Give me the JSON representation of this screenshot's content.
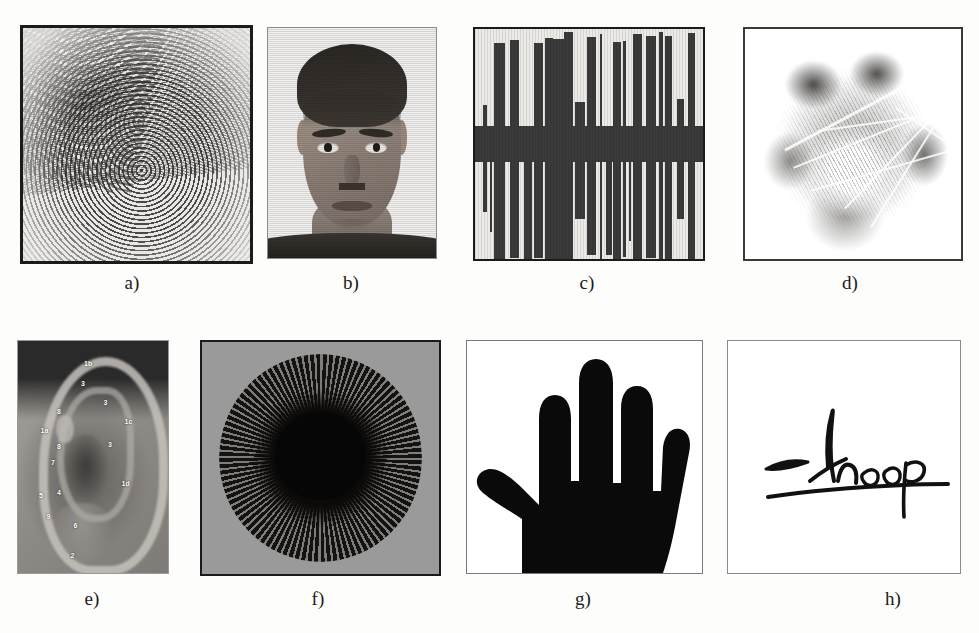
{
  "figure": {
    "background_color": "#fdfdfc",
    "rows": 2,
    "columns": 4
  },
  "panels": [
    {
      "id": "a",
      "label": "a)",
      "trait": "fingerprint",
      "icon": "fingerprint-icon",
      "border_color": "#1b1b1b",
      "background_color": "#e8e7e3"
    },
    {
      "id": "b",
      "label": "b)",
      "trait": "face",
      "icon": "face-icon",
      "border_color": "#8a8a8a",
      "background_color": "#f2f1ef"
    },
    {
      "id": "c",
      "label": "c)",
      "trait": "voice",
      "icon": "waveform-icon",
      "border_color": "#1b1b1b",
      "background_color": "#eceae6"
    },
    {
      "id": "d",
      "label": "d)",
      "trait": "palmprint",
      "icon": "palmprint-icon",
      "border_color": "#3a3a3a",
      "background_color": "#ffffff"
    },
    {
      "id": "e",
      "label": "e)",
      "trait": "ear",
      "icon": "ear-icon",
      "border_color": "#9a9a9a",
      "background_color": "#8e8e8e"
    },
    {
      "id": "f",
      "label": "f)",
      "trait": "iris",
      "icon": "iris-icon",
      "border_color": "#1b1b1b",
      "background_color": "#9a9a9a"
    },
    {
      "id": "g",
      "label": "g)",
      "trait": "hand geometry",
      "icon": "hand-icon",
      "border_color": "#7a7a7a",
      "background_color": "#ffffff"
    },
    {
      "id": "h",
      "label": "h)",
      "trait": "signature",
      "icon": "signature-icon",
      "border_color": "#8a8a8a",
      "background_color": "#ffffff"
    }
  ],
  "ear_annotations": [
    {
      "text": "1b",
      "x": 44,
      "y": 8
    },
    {
      "text": "3",
      "x": 42,
      "y": 17
    },
    {
      "text": "3",
      "x": 57,
      "y": 25
    },
    {
      "text": "8",
      "x": 26,
      "y": 29
    },
    {
      "text": "1c",
      "x": 71,
      "y": 33
    },
    {
      "text": "1a",
      "x": 15,
      "y": 37
    },
    {
      "text": "8",
      "x": 26,
      "y": 44
    },
    {
      "text": "3",
      "x": 60,
      "y": 43
    },
    {
      "text": "7",
      "x": 22,
      "y": 51
    },
    {
      "text": "1d",
      "x": 69,
      "y": 60
    },
    {
      "text": "5",
      "x": 14,
      "y": 65
    },
    {
      "text": "4",
      "x": 26,
      "y": 64
    },
    {
      "text": "9",
      "x": 19,
      "y": 74
    },
    {
      "text": "6",
      "x": 37,
      "y": 78
    },
    {
      "text": "2",
      "x": 35,
      "y": 91
    }
  ],
  "signature": {
    "name": "Anoop",
    "ink_color": "#111111"
  }
}
